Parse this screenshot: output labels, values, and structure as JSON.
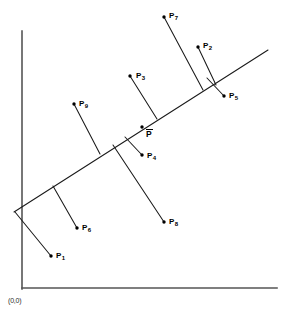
{
  "figure": {
    "caption_origin": "(0,0)",
    "colors": {
      "axis": "#555555",
      "line": "#1a1a1a",
      "point": "#000000",
      "background": "#ffffff"
    },
    "axes": {
      "y_axis": {
        "x1": 22,
        "y1": 31,
        "x2": 22,
        "y2": 289
      },
      "x_axis": {
        "x1": 22,
        "y1": 288,
        "x2": 277,
        "y2": 288
      },
      "origin_label": "(0,0)",
      "origin_label_x": 8,
      "origin_label_y": 297
    },
    "fit_line": {
      "name": "regression-line",
      "x1": 14,
      "y1": 212,
      "x2": 268,
      "y2": 50
    },
    "mean_point": {
      "label": "P",
      "overbar": true,
      "dot_x": 142,
      "dot_y": 127,
      "label_x": 146,
      "label_y": 129
    },
    "points": [
      {
        "id": "P1",
        "label": "P",
        "subscript": "1",
        "dot_x": 51,
        "dot_y": 256,
        "foot_x": 15,
        "foot_y": 212,
        "label_x": 56,
        "label_y": 252
      },
      {
        "id": "P2",
        "label": "P",
        "subscript": "2",
        "dot_x": 198,
        "dot_y": 47,
        "foot_x": 216,
        "foot_y": 85,
        "label_x": 203,
        "label_y": 42
      },
      {
        "id": "P3",
        "label": "P",
        "subscript": "3",
        "dot_x": 130,
        "dot_y": 76,
        "foot_x": 157,
        "foot_y": 119,
        "label_x": 136,
        "label_y": 72
      },
      {
        "id": "P4",
        "label": "P",
        "subscript": "4",
        "dot_x": 142,
        "dot_y": 155,
        "foot_x": 125,
        "foot_y": 137,
        "label_x": 147,
        "label_y": 152
      },
      {
        "id": "P5",
        "label": "P",
        "subscript": "5",
        "dot_x": 224,
        "dot_y": 96,
        "foot_x": 207,
        "foot_y": 78,
        "label_x": 229,
        "label_y": 92
      },
      {
        "id": "P6",
        "label": "P",
        "subscript": "6",
        "dot_x": 77,
        "dot_y": 228,
        "foot_x": 53,
        "foot_y": 186,
        "label_x": 82,
        "label_y": 224
      },
      {
        "id": "P7",
        "label": "P",
        "subscript": "7",
        "dot_x": 164,
        "dot_y": 17,
        "foot_x": 203,
        "foot_y": 90,
        "label_x": 169,
        "label_y": 12
      },
      {
        "id": "P8",
        "label": "P",
        "subscript": "8",
        "dot_x": 164,
        "dot_y": 222,
        "foot_x": 113,
        "foot_y": 145,
        "label_x": 169,
        "label_y": 218
      },
      {
        "id": "P9",
        "label": "P",
        "subscript": "9",
        "dot_x": 74,
        "dot_y": 104,
        "foot_x": 100,
        "foot_y": 154,
        "label_x": 79,
        "label_y": 100
      }
    ]
  }
}
